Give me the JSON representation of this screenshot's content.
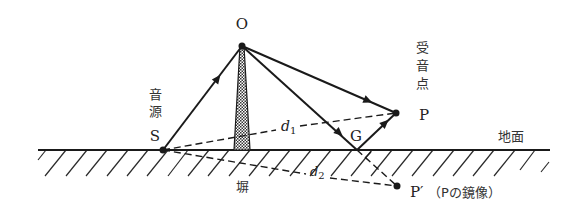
{
  "diagram": {
    "type": "acoustic barrier diffraction / ground reflection diagram",
    "colors": {
      "line": "#1a1a1a",
      "background": "#ffffff",
      "text": "#222222"
    },
    "points": {
      "O": {
        "label": "O",
        "x": 242,
        "y": 46
      },
      "S": {
        "label": "S",
        "x": 163,
        "y": 150,
        "caption": "音源"
      },
      "P": {
        "label": "P",
        "x": 396,
        "y": 113,
        "caption": "受音点"
      },
      "G": {
        "label": "G",
        "x": 357,
        "y": 150
      },
      "P_prime": {
        "label": "P′",
        "x": 397,
        "y": 186,
        "caption": "（Pの鏡像）"
      }
    },
    "labels": {
      "O": "O",
      "S": "S",
      "source_line1": "音",
      "source_line2": "源",
      "P": "P",
      "receiver_line1": "受",
      "receiver_line2": "音",
      "receiver_line3": "点",
      "G": "G",
      "P_prime": "P′",
      "P_prime_caption": "（Pの鏡像）",
      "barrier": "塀",
      "ground": "地面",
      "d1": "d",
      "d1_sub": "1",
      "d2": "d",
      "d2_sub": "2"
    },
    "paths": [
      {
        "from": "S",
        "to": "O",
        "style": "solid-arrow"
      },
      {
        "from": "O",
        "to": "P",
        "style": "solid-arrow"
      },
      {
        "from": "O",
        "to": "G",
        "style": "solid-arrow"
      },
      {
        "from": "G",
        "to": "P",
        "style": "solid-arrow"
      },
      {
        "from": "S",
        "to": "P",
        "style": "dashed",
        "name": "d1"
      },
      {
        "from": "S",
        "to": "P_prime",
        "style": "dashed",
        "name": "d2"
      },
      {
        "from": "G",
        "to": "P_prime",
        "style": "dashed"
      }
    ]
  }
}
